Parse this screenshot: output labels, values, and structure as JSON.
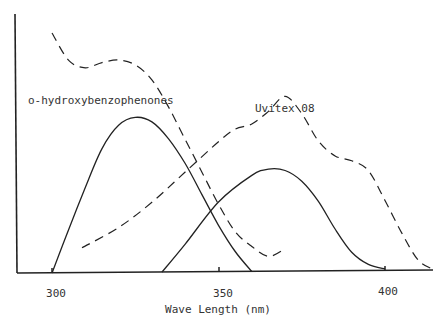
{
  "chart_data": {
    "type": "line",
    "title": "",
    "xlabel": "Wave Length (nm)",
    "ylabel": "",
    "xlim": [
      289,
      420
    ],
    "x_ticks": [
      300,
      350,
      400
    ],
    "x_tick_labels": [
      "300",
      "350",
      "400"
    ],
    "grid": false,
    "legend": "inline annotations",
    "annotations": [
      {
        "text": "o-hydroxybenzophenones",
        "near_series": "o-hydroxybenzophenones (absorption)"
      },
      {
        "text": "Uvitex 08",
        "near_series": "Uvitex 08 (absorption)"
      }
    ],
    "y_units": "relative intensity (unlabeled, 0-1)",
    "series": [
      {
        "name": "o-hydroxybenzophenones (absorption)",
        "style": "solid",
        "x": [
          300,
          305,
          310,
          315,
          320,
          325,
          330,
          335,
          340,
          345,
          350,
          355,
          360
        ],
        "values": [
          0.0,
          0.28,
          0.55,
          0.8,
          0.95,
          1.0,
          0.97,
          0.86,
          0.7,
          0.5,
          0.3,
          0.13,
          0.0
        ]
      },
      {
        "name": "Uvitex 08 (absorption)",
        "style": "solid",
        "x": [
          333,
          340,
          350,
          360,
          365,
          370,
          375,
          380,
          385,
          390,
          395,
          400
        ],
        "values": [
          0.0,
          0.18,
          0.45,
          0.62,
          0.66,
          0.65,
          0.58,
          0.45,
          0.27,
          0.12,
          0.04,
          0.01
        ]
      },
      {
        "name": "dashed curve A",
        "style": "dashed",
        "x": [
          300,
          305,
          310,
          315,
          320,
          325,
          330,
          335,
          340,
          345,
          350,
          355,
          360,
          365,
          370
        ],
        "values": [
          0.96,
          0.85,
          0.82,
          0.84,
          0.85,
          0.83,
          0.77,
          0.66,
          0.53,
          0.4,
          0.27,
          0.16,
          0.1,
          0.06,
          0.09
        ]
      },
      {
        "name": "dashed curve B",
        "style": "dashed",
        "x": [
          309,
          320,
          330,
          340,
          350,
          355,
          360,
          365,
          370,
          375,
          380,
          385,
          390,
          395,
          400,
          405,
          410,
          415
        ],
        "values": [
          0.1,
          0.18,
          0.28,
          0.4,
          0.52,
          0.57,
          0.59,
          0.64,
          0.7,
          0.63,
          0.52,
          0.46,
          0.44,
          0.4,
          0.28,
          0.15,
          0.04,
          0.0
        ]
      }
    ]
  },
  "labels": {
    "tick_300": "300",
    "tick_350": "350",
    "tick_400": "400",
    "xlabel": "Wave Length (nm)",
    "series_1": "o-hydroxybenzophenones",
    "series_2": "Uvitex 08"
  }
}
